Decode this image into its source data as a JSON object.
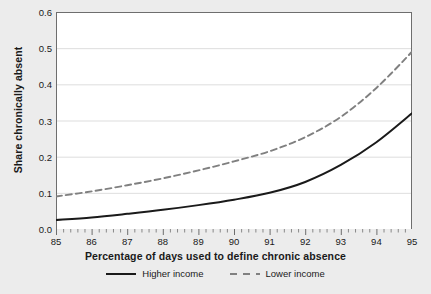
{
  "chart_data": {
    "type": "line",
    "title": "",
    "xlabel": "Percentage of days used to define chronic absence",
    "ylabel": "Share chronically absent",
    "xlim": [
      85,
      95
    ],
    "ylim": [
      0.0,
      0.6
    ],
    "grid": "horizontal",
    "legend_position": "bottom",
    "xticks": [
      "85",
      "86",
      "87",
      "88",
      "89",
      "90",
      "91",
      "92",
      "93",
      "94",
      "95"
    ],
    "yticks": [
      "0.0",
      "0.1",
      "0.2",
      "0.3",
      "0.4",
      "0.5",
      "0.6"
    ],
    "x": [
      85,
      86,
      87,
      88,
      89,
      90,
      91,
      92,
      93,
      94,
      95
    ],
    "series": [
      {
        "name": "Higher income",
        "style": "solid",
        "color": "#1a1a1a",
        "values": [
          0.025,
          0.032,
          0.042,
          0.053,
          0.066,
          0.081,
          0.1,
          0.13,
          0.177,
          0.24,
          0.32
        ]
      },
      {
        "name": "Lower income",
        "style": "dashed",
        "color": "#808080",
        "values": [
          0.09,
          0.104,
          0.121,
          0.14,
          0.162,
          0.187,
          0.215,
          0.254,
          0.31,
          0.39,
          0.49
        ]
      }
    ]
  },
  "colors": {
    "canvas": "#ececec",
    "panel": "#ffffff",
    "gridline": "#d4d4d4",
    "axis": "#6e6e6e",
    "higher_income": "#1a1a1a",
    "lower_income": "#808080"
  }
}
